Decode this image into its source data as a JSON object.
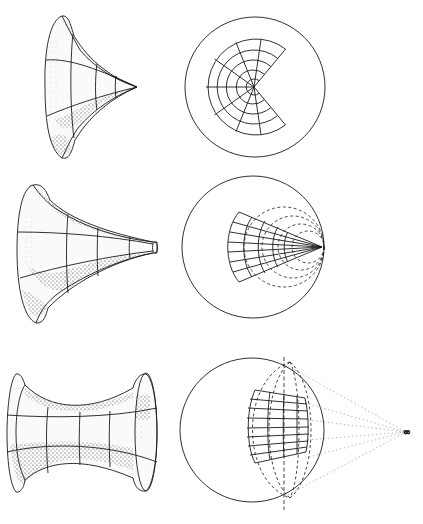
{
  "figure": {
    "panels": [
      {
        "id": "row-1",
        "surface": "pseudosphere-cone",
        "model": "sector-disk-in-circle",
        "description": "Horn-shaped surface with apex; disk model with sector removed"
      },
      {
        "id": "row-2",
        "surface": "trumpet-horn",
        "model": "wedge-tangent-to-circle",
        "description": "Trumpet surface; wedge meeting circle boundary at a point with dashed horocycles"
      },
      {
        "id": "row-3",
        "surface": "catenoid-like-saddle",
        "model": "region-with-ultra-ideal-point",
        "description": "Saddle surface between two rims; model region with lines converging to point at infinity"
      }
    ],
    "labels": {
      "infinity": "∞"
    },
    "colors": {
      "ink": "#1a1a1a",
      "background": "#ffffff",
      "dotted": "#9a9a9a"
    }
  }
}
